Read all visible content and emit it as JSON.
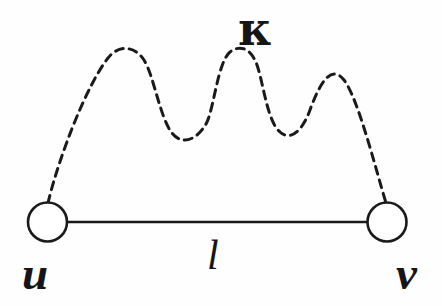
{
  "figure": {
    "background_color": "#fefefe",
    "ink_color": "#1a1a1a",
    "width": 442,
    "height": 306
  },
  "nodes": [
    {
      "id": "u",
      "label": "u",
      "cx": 47.5,
      "cy": 222,
      "r": 19.5,
      "stroke_width": 2.6,
      "fill": "#ffffff",
      "label_position": "below-left"
    },
    {
      "id": "v",
      "label": "v",
      "cx": 387,
      "cy": 222,
      "r": 19.5,
      "stroke_width": 2.6,
      "fill": "#ffffff",
      "label_position": "below-right"
    }
  ],
  "edges": [
    {
      "id": "solid-edge",
      "style": "solid",
      "label": "l",
      "from": "u",
      "to": "v",
      "x1": 67,
      "y1": 222,
      "x2": 367,
      "y2": 222,
      "stroke_width": 2.6,
      "label_x": 216,
      "label_y": 262
    },
    {
      "id": "dashed-wavy-edge",
      "style": "dashed",
      "label": "κ",
      "from": "u",
      "to": "v",
      "stroke_width": 3.0,
      "dash_array": "8 6",
      "peaks_y": 50,
      "troughs_y": 135,
      "peaks_x": [
        125,
        218,
        307
      ],
      "troughs_x": [
        172,
        258
      ],
      "start_x": 48,
      "start_y": 203,
      "end_x": 386,
      "end_y": 203,
      "label_x": 258,
      "label_y": 32
    }
  ],
  "labels": {
    "node_u": "u",
    "node_v": "v",
    "edge_length": "l",
    "edge_kappa": "κ"
  },
  "icon_names": {
    "node": "circle-node-icon",
    "solid_edge": "solid-line-icon",
    "dashed_edge": "dashed-wave-icon"
  }
}
